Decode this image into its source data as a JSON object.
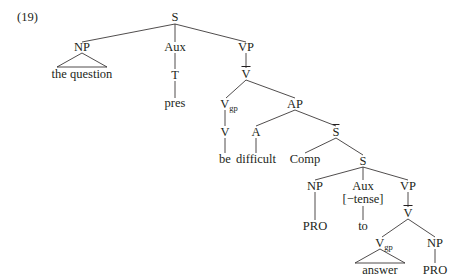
{
  "example_number": "(19)",
  "tree": {
    "root": {
      "label": "S"
    },
    "subject_np": {
      "label": "NP",
      "yield": "the question"
    },
    "aux": {
      "label": "Aux",
      "child": "T",
      "leaf": "pres"
    },
    "vp": {
      "label": "VP",
      "vbar": "V",
      "vgp": {
        "label": "V",
        "sub": "gp"
      },
      "v": "V",
      "v_leaf": "be"
    },
    "ap": {
      "label": "AP",
      "a": "A",
      "a_leaf": "difficult",
      "sbar": "S",
      "comp": "Comp"
    },
    "embedded_s": {
      "label": "S",
      "np": {
        "label": "NP",
        "leaf": "PRO"
      },
      "aux": {
        "label": "Aux",
        "feature": "[−tense]",
        "leaf": "to"
      },
      "vp": {
        "label": "VP",
        "vbar": "V",
        "vgp": {
          "label": "V",
          "sub": "gp",
          "yield": "answer"
        },
        "np": {
          "label": "NP",
          "leaf": "PRO"
        }
      }
    }
  },
  "colors": {
    "text": "#231f20",
    "lines": "#231f20",
    "background": "#ffffff"
  }
}
